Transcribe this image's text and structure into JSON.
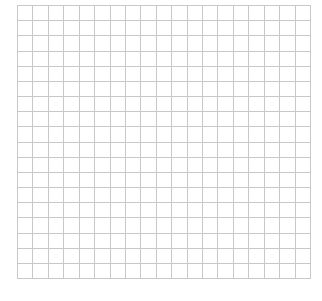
{
  "grid": {
    "columns": 19,
    "rows": 18,
    "line_color": "#c8c8c8",
    "background": "#ffffff"
  }
}
